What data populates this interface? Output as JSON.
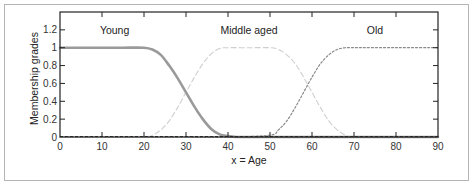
{
  "chart_data": {
    "type": "line",
    "title": "",
    "xlabel": "x = Age",
    "ylabel": "Membership grades",
    "xlim": [
      0,
      90
    ],
    "ylim": [
      0,
      1.4
    ],
    "xticks": [
      0,
      10,
      20,
      30,
      40,
      50,
      60,
      70,
      80,
      90
    ],
    "yticks": [
      0,
      0.2,
      0.4,
      0.6,
      0.8,
      1,
      1.2
    ],
    "ytick_labels": [
      "0",
      "0.2",
      "0.4",
      "0.6",
      "0.8",
      "1",
      "1.2"
    ],
    "grid": false,
    "legend": "none (inline curve labels)",
    "annotations": [
      {
        "text": "Young",
        "x": 13,
        "y": 1.2
      },
      {
        "text": "Middle aged",
        "x": 45,
        "y": 1.2
      },
      {
        "text": "Old",
        "x": 75,
        "y": 1.2
      }
    ],
    "series": [
      {
        "name": "Young",
        "style": "solid-thick",
        "color": "#9a9a9a",
        "x": [
          0,
          5,
          10,
          15,
          20,
          22,
          24,
          26,
          28,
          30,
          32,
          34,
          36,
          38,
          40,
          42,
          45,
          50,
          60,
          70,
          80,
          90
        ],
        "values": [
          1,
          1,
          1,
          1,
          1,
          0.98,
          0.92,
          0.8,
          0.66,
          0.5,
          0.34,
          0.2,
          0.09,
          0.03,
          0.01,
          0,
          0,
          0,
          0,
          0,
          0,
          0
        ]
      },
      {
        "name": "Middle aged",
        "style": "dashed-light",
        "color": "#cfcfcf",
        "x": [
          0,
          10,
          20,
          22,
          24,
          26,
          28,
          30,
          32,
          34,
          36,
          38,
          40,
          45,
          50,
          52,
          54,
          56,
          58,
          60,
          62,
          64,
          66,
          68,
          70,
          80,
          90
        ],
        "values": [
          0,
          0,
          0,
          0.02,
          0.08,
          0.18,
          0.33,
          0.5,
          0.67,
          0.82,
          0.93,
          0.99,
          1,
          1,
          1,
          0.98,
          0.92,
          0.82,
          0.67,
          0.5,
          0.33,
          0.18,
          0.08,
          0.02,
          0,
          0,
          0
        ]
      },
      {
        "name": "Old",
        "style": "dotted",
        "color": "#8a8a8a",
        "x": [
          0,
          10,
          20,
          30,
          40,
          50,
          52,
          54,
          56,
          58,
          60,
          62,
          64,
          66,
          68,
          70,
          80,
          90
        ],
        "values": [
          0,
          0,
          0,
          0,
          0,
          0.02,
          0.08,
          0.18,
          0.33,
          0.5,
          0.67,
          0.82,
          0.92,
          0.98,
          1,
          1,
          1,
          1
        ]
      }
    ]
  }
}
